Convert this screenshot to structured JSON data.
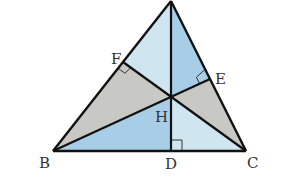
{
  "diagram": {
    "type": "triangle-orthocenter",
    "points": {
      "A": {
        "x": 171,
        "y": 1
      },
      "B": {
        "x": 53,
        "y": 151
      },
      "C": {
        "x": 246,
        "y": 151
      },
      "D": {
        "x": 171,
        "y": 151
      },
      "E": {
        "x": 210,
        "y": 79
      },
      "F": {
        "x": 123,
        "y": 62
      },
      "H": {
        "x": 171,
        "y": 97
      }
    },
    "labels": {
      "B": "B",
      "C": "C",
      "D": "D",
      "E": "E",
      "F": "F",
      "H": "H"
    },
    "regions": [
      {
        "name": "AFH",
        "color": "#cfe5ef"
      },
      {
        "name": "AHE",
        "color": "#a8cde6"
      },
      {
        "name": "BFH",
        "color": "#c8c8c5"
      },
      {
        "name": "BHD",
        "color": "#a8cde6"
      },
      {
        "name": "DHC",
        "color": "#cfe5ef"
      },
      {
        "name": "HEC",
        "color": "#c8c8c5"
      }
    ],
    "segments": [
      "AB",
      "BC",
      "CA",
      "AD",
      "BE",
      "CF"
    ],
    "right_angles": [
      "D",
      "E",
      "F"
    ],
    "colors": {
      "stroke": "#111111",
      "light_blue": "#cfe5ef",
      "medium_blue": "#a8cde6",
      "gray": "#c8c8c5"
    }
  }
}
